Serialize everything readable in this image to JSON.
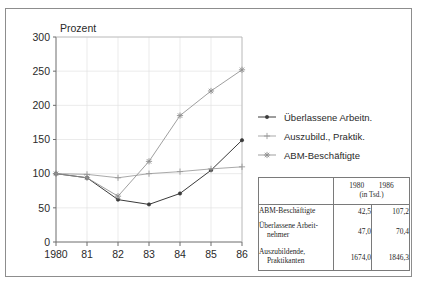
{
  "chart_data": {
    "type": "line",
    "title": "",
    "ylabel": "Prozent",
    "xlabel": "",
    "categories": [
      "1980",
      "81",
      "82",
      "83",
      "84",
      "85",
      "86"
    ],
    "x_tick_labels": [
      "1980",
      "81",
      "82",
      "83",
      "84",
      "85",
      "86"
    ],
    "y_tick_labels": [
      "0",
      "50",
      "100",
      "150",
      "200",
      "250",
      "300"
    ],
    "y_ticks": [
      0,
      50,
      100,
      150,
      200,
      250,
      300
    ],
    "ylim": [
      0,
      300
    ],
    "grid": true,
    "legend_position": "right",
    "series": [
      {
        "name": "Überlassene Arbeitn.",
        "marker": "dot",
        "color": "#3a3a3a",
        "values": [
          100,
          94,
          62,
          55,
          71,
          105,
          149
        ]
      },
      {
        "name": "Auszubild., Praktik.",
        "marker": "plus",
        "color": "#9a9a9a",
        "values": [
          100,
          99,
          94,
          100,
          103,
          107,
          110
        ]
      },
      {
        "name": "ABM-Beschäftigte",
        "marker": "asterisk",
        "color": "#8e8e8e",
        "values": [
          100,
          94,
          67,
          118,
          185,
          221,
          252
        ]
      }
    ]
  },
  "legend": {
    "items": [
      {
        "label": "Überlassene Arbeitn."
      },
      {
        "label": "Auszubild., Praktik."
      },
      {
        "label": "ABM-Beschäftigte"
      }
    ]
  },
  "table": {
    "header": {
      "col1": "1980",
      "col2": "1986",
      "unit": "(in Tsd.)"
    },
    "rows": [
      {
        "name": "ABM-Beschäftigte",
        "name2": "",
        "v1980": "42,5",
        "v1986": "107,2"
      },
      {
        "name": "Überlassene Arbeit-",
        "name2": "nehmer",
        "v1980": "47,0",
        "v1986": "70,4"
      },
      {
        "name": "Auszubildende,",
        "name2": "Praktikanten",
        "v1980": "1674,0",
        "v1986": "1846,3"
      }
    ]
  }
}
